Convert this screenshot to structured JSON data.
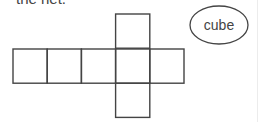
{
  "caption": "the net.",
  "diagram": {
    "type": "cube-net",
    "squares": [
      {
        "row": 0,
        "col": 3
      },
      {
        "row": 1,
        "col": 0
      },
      {
        "row": 1,
        "col": 1
      },
      {
        "row": 1,
        "col": 2
      },
      {
        "row": 1,
        "col": 3
      },
      {
        "row": 1,
        "col": 4
      },
      {
        "row": 2,
        "col": 3
      }
    ],
    "label": "cube",
    "stroke_color": "#444444"
  }
}
